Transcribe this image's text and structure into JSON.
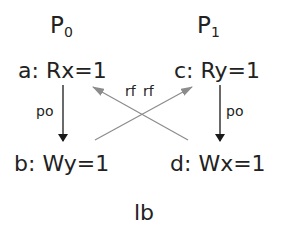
{
  "diagram": {
    "title": "lb",
    "processes": [
      {
        "name": "P",
        "index": "0"
      },
      {
        "name": "P",
        "index": "1"
      }
    ],
    "events": {
      "a": {
        "label": "a:",
        "op": "Rx=1"
      },
      "b": {
        "label": "b:",
        "op": "Wy=1"
      },
      "c": {
        "label": "c:",
        "op": "Ry=1"
      },
      "d": {
        "label": "d:",
        "op": "Wx=1"
      }
    },
    "edges": [
      {
        "from": "a",
        "to": "b",
        "label": "po",
        "color": "#1a1a1a"
      },
      {
        "from": "c",
        "to": "d",
        "label": "po",
        "color": "#1a1a1a"
      },
      {
        "from": "d",
        "to": "a",
        "label": "rf",
        "color": "#8c8c8c"
      },
      {
        "from": "b",
        "to": "c",
        "label": "rf",
        "color": "#8c8c8c"
      }
    ]
  }
}
